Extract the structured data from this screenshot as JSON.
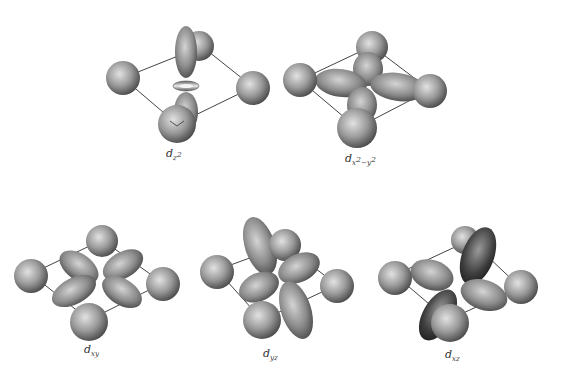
{
  "figure": {
    "panels": [
      {
        "id": "dz2",
        "label_main": "d",
        "label_sub": "z",
        "label_sup": "2",
        "label_text": "dz2"
      },
      {
        "id": "dx2y2",
        "label_main": "d",
        "label_sub": "x",
        "label_sup": "2",
        "label_sub2": "−y",
        "label_sup2": "2",
        "label_text": "dx2−y2"
      },
      {
        "id": "dxy",
        "label_main": "d",
        "label_sub": "xy",
        "label_text": "dxy"
      },
      {
        "id": "dyz",
        "label_main": "d",
        "label_sub": "yz",
        "label_text": "dyz"
      },
      {
        "id": "dxz",
        "label_main": "d",
        "label_sub": "xz",
        "label_text": "dxz"
      }
    ]
  },
  "colors": {
    "background": "#ffffff",
    "sphere_light": "#d8d8d8",
    "sphere_dark": "#4a4a4a",
    "lobe_light": "#c8c8c8",
    "lobe_dark": "#3a3a3a",
    "line": "#444444"
  }
}
